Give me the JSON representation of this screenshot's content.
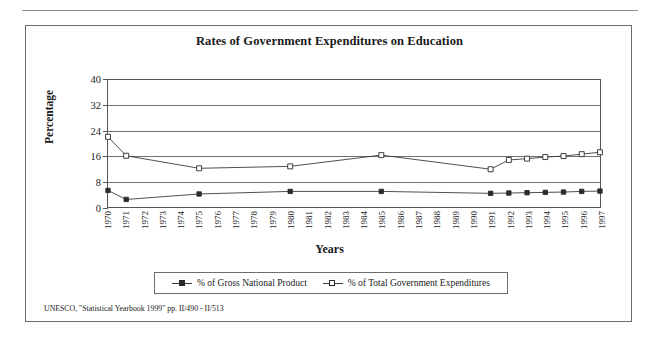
{
  "chart_data": {
    "type": "line",
    "title": "Rates of Government Expenditures on Education",
    "xlabel": "Years",
    "ylabel": "Percentage",
    "ylim": [
      0,
      40
    ],
    "yticks": [
      0,
      8,
      16,
      24,
      32,
      40
    ],
    "grid": true,
    "legend_position": "bottom",
    "categories": [
      "1970",
      "1971",
      "1972",
      "1973",
      "1974",
      "1975",
      "1976",
      "1977",
      "1978",
      "1979",
      "1980",
      "1981",
      "1982",
      "1983",
      "1984",
      "1985",
      "1986",
      "1987",
      "1988",
      "1989",
      "1990",
      "1991",
      "1992",
      "1993",
      "1994",
      "1995",
      "1996",
      "1997"
    ],
    "series": [
      {
        "name": "% of Gross National Product",
        "marker": "filled-square",
        "values": [
          5.3,
          2.5,
          null,
          null,
          null,
          4.2,
          null,
          null,
          null,
          null,
          5.0,
          null,
          null,
          null,
          null,
          5.0,
          null,
          null,
          null,
          null,
          null,
          4.4,
          4.5,
          4.6,
          4.7,
          4.8,
          5.0,
          5.1
        ]
      },
      {
        "name": "% of Total Government Expenditures",
        "marker": "open-square",
        "values": [
          22.0,
          16.1,
          null,
          null,
          null,
          12.2,
          null,
          null,
          null,
          null,
          12.8,
          null,
          null,
          null,
          null,
          16.3,
          null,
          null,
          null,
          null,
          null,
          11.9,
          14.8,
          15.2,
          15.7,
          16.0,
          16.6,
          17.2
        ]
      }
    ],
    "source_note": "UNESCO, \"Statistical Yearbook 1999\" pp. II/490 - II/513"
  }
}
